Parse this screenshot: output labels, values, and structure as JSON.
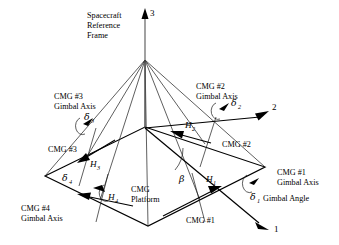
{
  "figure": {
    "type": "diagram",
    "colors": {
      "line": "#000000",
      "thin_line": "#1a1a1a",
      "gray_line": "#555555",
      "background": "#ffffff"
    }
  },
  "axes": {
    "axis_1_label": "1",
    "axis_2_label": "2",
    "axis_3_label": "3",
    "frame_label_line1": "Spacecraft",
    "frame_label_line2": "Reference",
    "frame_label_line3": "Frame"
  },
  "platform": {
    "label_line1": "CMG",
    "label_line2": "Platform"
  },
  "angles": {
    "beta": "β",
    "delta1": "δ",
    "delta2": "δ",
    "delta3": "δ",
    "delta4": "δ",
    "delta1_sub": "1",
    "delta2_sub": "2",
    "delta3_sub": "3",
    "delta4_sub": "4",
    "gimbal_angle_text": "Gimbal Angle"
  },
  "momenta": {
    "h1": "H",
    "h2": "H",
    "h3": "H",
    "h4": "H",
    "h1_sub": "1",
    "h2_sub": "2",
    "h3_sub": "3",
    "h4_sub": "4"
  },
  "cmgs": [
    {
      "id": "cmg1",
      "node_label": "CMG #1",
      "axis_label_line1": "CMG #1",
      "axis_label_line2": "Gimbal Axis"
    },
    {
      "id": "cmg2",
      "node_label": "CMG #2",
      "axis_label_line1": "CMG #2",
      "axis_label_line2": "Gimbal Axis"
    },
    {
      "id": "cmg3",
      "node_label": "CMG #3",
      "axis_label_line1": "CMG #3",
      "axis_label_line2": "Gimbal Axis"
    },
    {
      "id": "cmg4",
      "node_label": "CMG #4",
      "axis_label_line1": "CMG #4",
      "axis_label_line2": "Gimbal Axis"
    }
  ]
}
